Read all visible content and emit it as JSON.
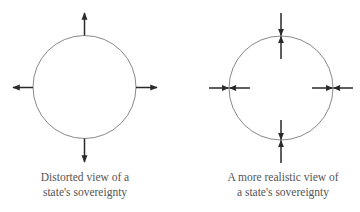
{
  "colors": {
    "circle_stroke": "#6a6a6a",
    "arrow": "#2a2a2a",
    "caption_text": "#555555",
    "background": "#ffffff"
  },
  "panels": [
    {
      "id": "distorted",
      "caption_lines": [
        "Distorted view of a",
        "state's sovereignty"
      ],
      "arrow_direction": "outward",
      "arrow_count": 4
    },
    {
      "id": "realistic",
      "caption_lines": [
        "A more realistic view of",
        "a state's sovereignty"
      ],
      "arrow_direction": "opposing (inward and outward pairs meeting at the boundary)",
      "arrow_count": 8
    }
  ]
}
